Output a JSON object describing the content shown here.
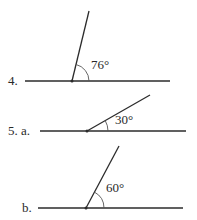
{
  "top_cutoff_text": "",
  "figures": [
    {
      "id": "4",
      "label": "4.",
      "angle_label": "76°",
      "angle_degrees": 76,
      "baseline": {
        "x1": 25,
        "x2": 170,
        "y": 81
      },
      "vertex": {
        "x": 72,
        "y": 81
      },
      "ray_end": {
        "x": 89,
        "y": 11
      },
      "arc_radius": 17,
      "label_pos": {
        "x": 8,
        "y": 74
      },
      "angle_label_pos": {
        "x": 91,
        "y": 58
      }
    },
    {
      "id": "5a",
      "label": "5. a.",
      "angle_label": "30°",
      "angle_degrees": 30,
      "baseline": {
        "x1": 40,
        "x2": 186,
        "y": 131
      },
      "vertex": {
        "x": 87,
        "y": 131
      },
      "ray_end": {
        "x": 150,
        "y": 95
      },
      "arc_radius": 21,
      "label_pos": {
        "x": 8,
        "y": 124
      },
      "angle_label_pos": {
        "x": 115,
        "y": 113
      }
    },
    {
      "id": "5b",
      "label": "b.",
      "angle_label": "60°",
      "angle_degrees": 60,
      "baseline": {
        "x1": 38,
        "x2": 183,
        "y": 208
      },
      "vertex": {
        "x": 86,
        "y": 208
      },
      "ray_end": {
        "x": 119,
        "y": 146
      },
      "arc_radius": 18,
      "label_pos": {
        "x": 22,
        "y": 201
      },
      "angle_label_pos": {
        "x": 106,
        "y": 181
      }
    }
  ],
  "colors": {
    "line": "#2b2b2b",
    "arc": "#555555",
    "text": "#2a2a2a"
  }
}
